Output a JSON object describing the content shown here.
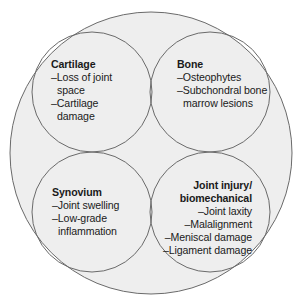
{
  "diagram": {
    "type": "venn",
    "colors": {
      "background": "#ffffff",
      "fill": "#eeeeee",
      "stroke": "#6a6a6a",
      "text": "#1a1a1a"
    },
    "outer_circle": {
      "cx": 151,
      "cy": 153,
      "r": 141
    },
    "circles": [
      {
        "id": "cartilage",
        "cx": 92,
        "cy": 92,
        "r": 60
      },
      {
        "id": "bone",
        "cx": 210,
        "cy": 92,
        "r": 60
      },
      {
        "id": "synovium",
        "cx": 92,
        "cy": 212,
        "r": 60
      },
      {
        "id": "joint-injury",
        "cx": 210,
        "cy": 212,
        "r": 60
      }
    ]
  },
  "cartilage": {
    "title": "Cartilage",
    "items": [
      "–Loss of joint",
      "space",
      "–Cartilage",
      "damage"
    ]
  },
  "bone": {
    "title": "Bone",
    "items": [
      "–Osteophytes",
      "–Subchondral bone",
      "marrow lesions"
    ]
  },
  "synovium": {
    "title": "Synovium",
    "items": [
      "–Joint swelling",
      "–Low-grade",
      "inflammation"
    ]
  },
  "joint_injury": {
    "title_line1": "Joint injury/",
    "title_line2": "biomechanical",
    "items": [
      "–Joint laxity",
      "–Malalignment",
      "–Meniscal damage",
      "–Ligament damage"
    ]
  }
}
